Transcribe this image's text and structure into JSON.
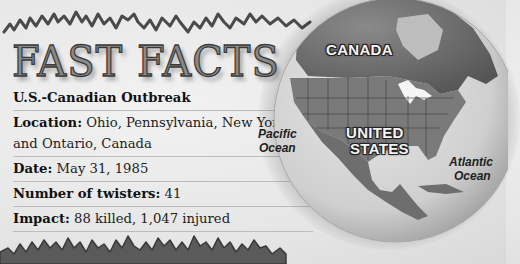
{
  "title": "FAST FACTS",
  "facts": {
    "heading": "U.S.-Canadian Outbreak",
    "items": [
      {
        "label": "Location:",
        "value": " Ohio, Pennsylvania, New York, and Ontario, Canada"
      },
      {
        "label": "Date:",
        "value": " May 31, 1985"
      },
      {
        "label": "Number of twisters:",
        "value": " 41"
      },
      {
        "label": "Impact:",
        "value": " 88 killed, 1,047 injured"
      }
    ]
  },
  "map": {
    "labels": {
      "canada": "CANADA",
      "united": "UNITED",
      "states": "STATES",
      "pacific": "Pacific",
      "pacific_ocean": "Ocean",
      "atlantic": "Atlantic",
      "atlantic_ocean": "Ocean"
    }
  }
}
